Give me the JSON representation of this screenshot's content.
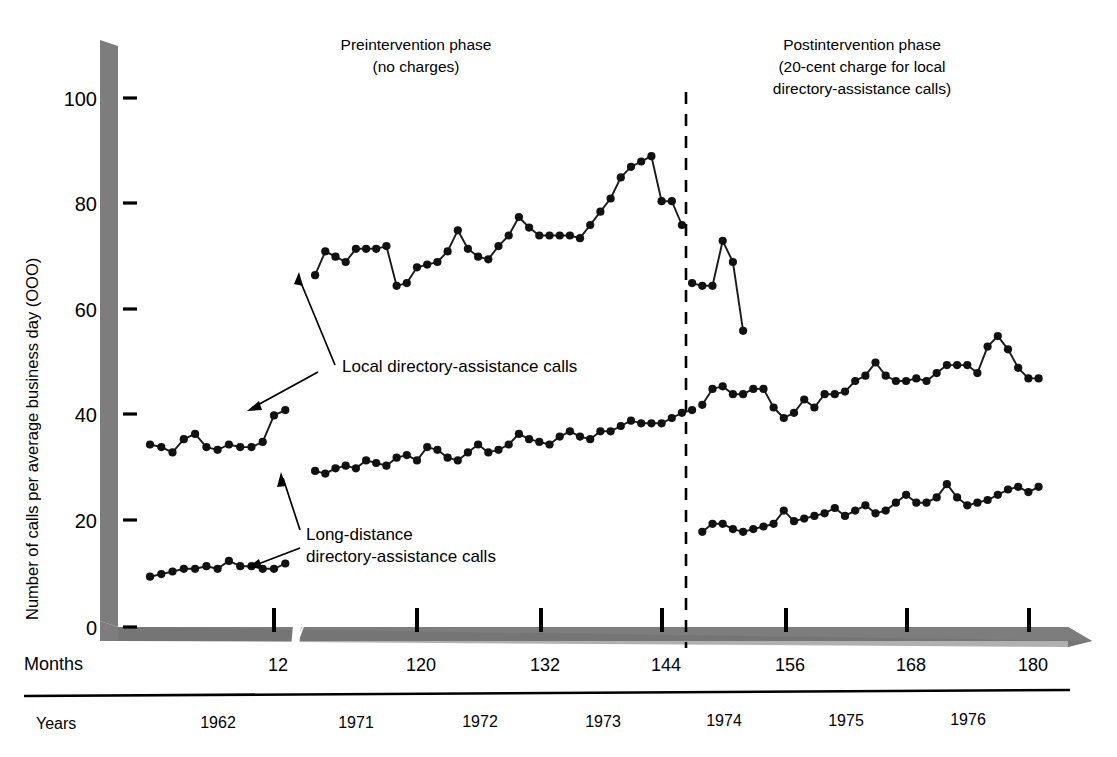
{
  "figure": {
    "width": 1117,
    "height": 757,
    "background": "#ffffff",
    "ink_color": "#1a1a1a",
    "axis_band_color": "#7d7d7d"
  },
  "annotations": {
    "pre_title_line1": "Preintervention phase",
    "pre_title_line2": "(no charges)",
    "post_title_line1": "Postintervention phase",
    "post_title_line2": "(20-cent charge for local",
    "post_title_line3": "directory-assistance calls)",
    "local_label": "Local directory-assistance calls",
    "long_label_line1": "Long-distance",
    "long_label_line2": "directory-assistance calls"
  },
  "axes": {
    "y_title": "Number of calls per average business day (OOO)",
    "y_ticks": [
      "0",
      "20",
      "40",
      "60",
      "80",
      "100"
    ],
    "y_tick_values": [
      0,
      20,
      40,
      60,
      80,
      100
    ],
    "months_row_label": "Months",
    "years_row_label": "Years",
    "month_ticks": [
      "12",
      "120",
      "132",
      "144",
      "156",
      "168",
      "180"
    ],
    "month_tick_values": [
      12,
      120,
      132,
      144,
      156,
      168,
      180
    ],
    "year_labels": [
      "1962",
      "1971",
      "1972",
      "1973",
      "1974",
      "1975",
      "1976"
    ],
    "axis_break_after_month": 12,
    "intervention_month": 147
  },
  "chart_data": {
    "type": "line",
    "xlabel": "Months",
    "ylabel": "Number of calls per average business day (OOO)",
    "xlim": [
      1,
      182
    ],
    "ylim": [
      0,
      105
    ],
    "grid": false,
    "legend_position": "inline-annotations",
    "axis_break": {
      "after_x": 13,
      "before_x": 110
    },
    "intervention_line_x": 147,
    "series": [
      {
        "name": "Local directory-assistance calls",
        "marker": "filled-circle",
        "segments": [
          {
            "phase": "preintervention",
            "x": [
              110,
              111,
              112,
              113,
              114,
              115,
              116,
              117,
              118,
              119,
              120,
              121,
              122,
              123,
              124,
              125,
              126,
              127,
              128,
              129,
              130,
              131,
              132,
              133,
              134,
              135,
              136,
              137,
              138,
              139,
              140,
              141,
              142,
              143,
              144,
              145,
              146
            ],
            "y": [
              66.5,
              71,
              70,
              69,
              71.5,
              71.5,
              71.5,
              72,
              64.5,
              65,
              68,
              68.5,
              69,
              71,
              75,
              71.5,
              70,
              69.5,
              72,
              74,
              77.5,
              75.5,
              74,
              74,
              74,
              74,
              73.5,
              76,
              78.5,
              81,
              85,
              87,
              88,
              89,
              80.5,
              80.5,
              76
            ]
          },
          {
            "phase": "preintervention-tail",
            "x": [
              147,
              148,
              149,
              150,
              151,
              152
            ],
            "y": [
              65,
              64.5,
              64.5,
              73,
              69,
              56
            ]
          },
          {
            "phase": "postintervention",
            "x": [
              148,
              149,
              150,
              151,
              152,
              153,
              154,
              155,
              156,
              157,
              158,
              159,
              160,
              161,
              162,
              163,
              164,
              165,
              166,
              167,
              168,
              169,
              170,
              171,
              172,
              173,
              174,
              175,
              176,
              177,
              178,
              179,
              180,
              181
            ],
            "y": [
              42,
              45,
              45.5,
              44,
              44,
              45,
              45,
              41.5,
              39.5,
              40.5,
              43,
              41.5,
              44,
              44,
              44.5,
              46.5,
              47.5,
              50,
              47.5,
              46.5,
              46.5,
              47,
              46.5,
              48,
              49.5,
              49.5,
              49.5,
              48,
              53,
              55,
              52.5,
              49,
              47,
              47
            ]
          }
        ]
      },
      {
        "name": "Long-distance directory-assistance calls",
        "marker": "filled-circle",
        "segments": [
          {
            "phase": "baseline-1962",
            "x": [
              1,
              2,
              3,
              4,
              5,
              6,
              7,
              8,
              9,
              10,
              11,
              12,
              13
            ],
            "y": [
              34.5,
              34,
              33,
              35.5,
              36.5,
              34,
              33.5,
              34.5,
              34,
              34,
              35,
              40,
              41
            ]
          },
          {
            "phase": "baseline-1962-low",
            "x": [
              1,
              2,
              3,
              4,
              5,
              6,
              7,
              8,
              9,
              10,
              11,
              12,
              13
            ],
            "y": [
              9.5,
              10,
              10.5,
              11,
              11,
              11.5,
              11,
              12.5,
              11.5,
              11.5,
              11,
              11,
              12
            ]
          },
          {
            "phase": "preintervention",
            "x": [
              110,
              111,
              112,
              113,
              114,
              115,
              116,
              117,
              118,
              119,
              120,
              121,
              122,
              123,
              124,
              125,
              126,
              127,
              128,
              129,
              130,
              131,
              132,
              133,
              134,
              135,
              136,
              137,
              138,
              139,
              140,
              141,
              142,
              143,
              144,
              145,
              146,
              147
            ],
            "y": [
              29.5,
              29,
              30,
              30.5,
              30,
              31.5,
              31,
              30.5,
              32,
              32.5,
              31.5,
              34,
              33.5,
              32,
              31.5,
              33,
              34.5,
              33,
              33.5,
              34.5,
              36.5,
              35.5,
              35,
              34.5,
              36,
              37,
              36,
              35.5,
              37,
              37,
              38,
              39,
              38.5,
              38.5,
              38.5,
              39.5,
              40.5,
              41
            ]
          },
          {
            "phase": "postintervention",
            "x": [
              148,
              149,
              150,
              151,
              152,
              153,
              154,
              155,
              156,
              157,
              158,
              159,
              160,
              161,
              162,
              163,
              164,
              165,
              166,
              167,
              168,
              169,
              170,
              171,
              172,
              173,
              174,
              175,
              176,
              177,
              178,
              179,
              180,
              181
            ],
            "y": [
              18,
              19.5,
              19.5,
              18.5,
              18,
              18.5,
              19,
              19.5,
              22,
              20,
              20.5,
              21,
              21.5,
              22.5,
              21,
              22,
              23,
              21.5,
              22,
              23.5,
              25,
              23.5,
              23.5,
              24.5,
              27,
              24.5,
              23,
              23.5,
              24,
              25,
              26,
              26.5,
              25.5,
              26.5
            ]
          }
        ]
      }
    ]
  }
}
